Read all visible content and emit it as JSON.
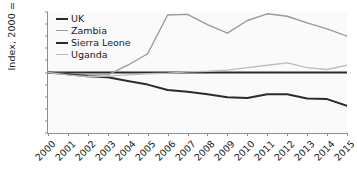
{
  "chart_data": {
    "type": "line",
    "title": "",
    "xlabel": "",
    "ylabel": "Index, 2000 = 100",
    "ylim": [
      0,
      200
    ],
    "yticks": [
      0,
      20,
      40,
      60,
      80,
      100,
      120,
      140,
      160,
      180,
      200
    ],
    "grid": false,
    "legend_position": "top-left",
    "x": [
      2000,
      2001,
      2002,
      2003,
      2004,
      2005,
      2006,
      2007,
      2008,
      2009,
      2010,
      2011,
      2012,
      2013,
      2014,
      2015
    ],
    "categories": [
      "2000",
      "2001",
      "2002",
      "2003",
      "2004",
      "2005",
      "2006",
      "2007",
      "2008",
      "2009",
      "2010",
      "2011",
      "2012",
      "2013",
      "2014",
      "2015"
    ],
    "series": [
      {
        "name": "UK",
        "color": "#2b2b2b",
        "width": 2.0,
        "values": [
          100,
          100,
          100,
          100,
          100,
          100,
          100,
          100,
          100,
          100,
          100,
          100,
          100,
          100,
          100,
          100
        ]
      },
      {
        "name": "Zambia",
        "color": "#9a9a9a",
        "width": 1.4,
        "values": [
          100,
          98,
          96,
          96,
          112,
          131,
          195,
          196,
          179,
          165,
          186,
          197,
          193,
          182,
          172,
          160
        ]
      },
      {
        "name": "Sierra Leone",
        "color": "#2b2b2b",
        "width": 2.0,
        "values": [
          100,
          97,
          94,
          92,
          86,
          80,
          71,
          68,
          64,
          59,
          58,
          64,
          64,
          57,
          56,
          45
        ]
      },
      {
        "name": "Uganda",
        "color": "#bdbdbd",
        "width": 1.4,
        "values": [
          100,
          96,
          93,
          94,
          96,
          98,
          99,
          101,
          102,
          104,
          108,
          112,
          116,
          108,
          105,
          112
        ]
      }
    ]
  },
  "legend": {
    "items": [
      {
        "label": "UK"
      },
      {
        "label": "Zambia"
      },
      {
        "label": "Sierra Leone"
      },
      {
        "label": "Uganda"
      }
    ]
  }
}
